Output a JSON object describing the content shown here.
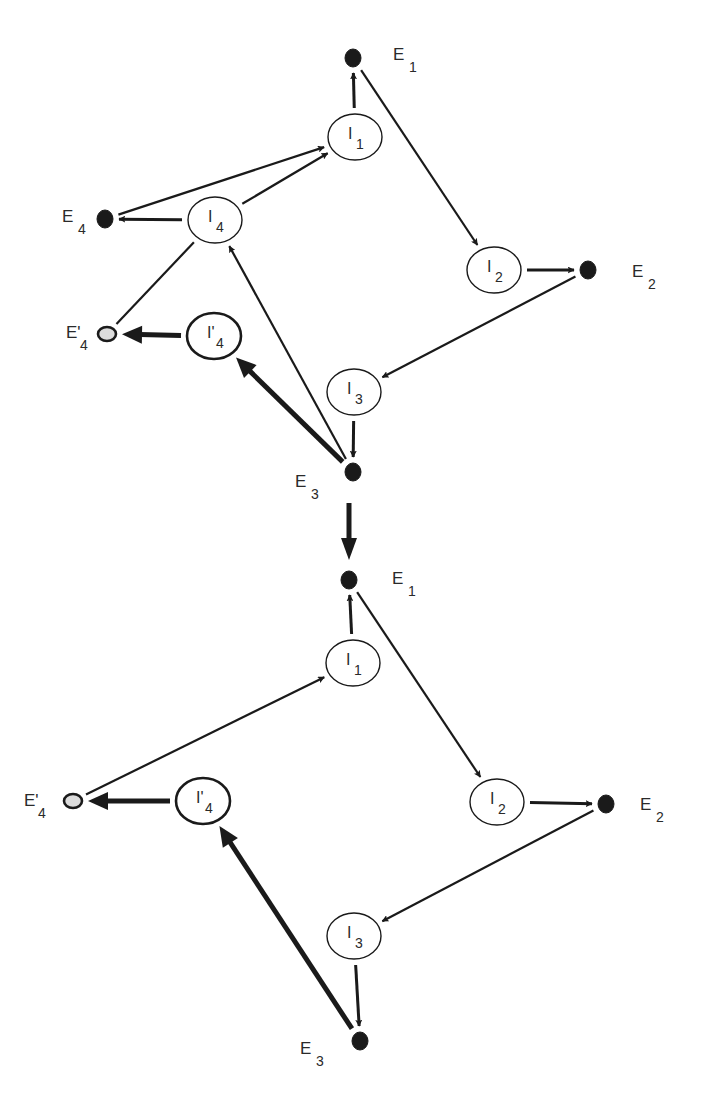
{
  "colors": {
    "stroke": "#1a1a1a",
    "filled_dot": "#1a1a1a",
    "open_dot_fill": "#dcdcdc",
    "background": "#ffffff"
  },
  "top_panel": {
    "nodes": [
      {
        "id": "E1",
        "kind": "dot",
        "x": 353,
        "y": 58,
        "label": "E",
        "sub": "1",
        "lx": 393,
        "ly": 60
      },
      {
        "id": "I1",
        "kind": "circle",
        "x": 355,
        "y": 137,
        "label": "I",
        "sub": "1"
      },
      {
        "id": "I2",
        "kind": "circle",
        "x": 494,
        "y": 270,
        "label": "I",
        "sub": "2"
      },
      {
        "id": "E2",
        "kind": "dot",
        "x": 588,
        "y": 270,
        "label": "E",
        "sub": "2",
        "lx": 632,
        "ly": 277
      },
      {
        "id": "I3",
        "kind": "circle",
        "x": 354,
        "y": 392,
        "label": "I",
        "sub": "3"
      },
      {
        "id": "E3",
        "kind": "dot",
        "x": 353,
        "y": 472,
        "label": "E",
        "sub": "3",
        "lx": 295,
        "ly": 487
      },
      {
        "id": "I4",
        "kind": "circle",
        "x": 215,
        "y": 220,
        "label": "I",
        "sub": "4"
      },
      {
        "id": "E4",
        "kind": "dot",
        "x": 105,
        "y": 219,
        "label": "E",
        "sub": "4",
        "lx": 62,
        "ly": 222
      },
      {
        "id": "I'4",
        "kind": "circle-thick",
        "x": 214,
        "y": 336,
        "label": "I'",
        "sub": "4"
      },
      {
        "id": "E'4",
        "kind": "open-dot",
        "x": 107,
        "y": 334,
        "label": "E'",
        "sub": "4",
        "lx": 66,
        "ly": 338
      }
    ],
    "edges": [
      {
        "from": "I1",
        "to": "E1",
        "weight": "normal"
      },
      {
        "from": "E1",
        "to": "I2",
        "weight": "thin"
      },
      {
        "from": "I2",
        "to": "E2",
        "weight": "normal"
      },
      {
        "from": "E2",
        "to": "I3",
        "weight": "thin"
      },
      {
        "from": "I3",
        "to": "E3",
        "weight": "normal"
      },
      {
        "from": "E3",
        "to": "I4",
        "weight": "thin"
      },
      {
        "from": "E3",
        "to": "I'4",
        "weight": "thick"
      },
      {
        "from": "I4",
        "to": "E4",
        "weight": "normal"
      },
      {
        "from": "E4",
        "to": "I1",
        "weight": "thin"
      },
      {
        "from": "I4",
        "to": "I1",
        "weight": "thin"
      },
      {
        "from": "E'4",
        "to": "I4",
        "weight": "thin",
        "arrow": false
      },
      {
        "from": "I'4",
        "to": "E'4",
        "weight": "thick"
      }
    ]
  },
  "transition_arrow": {
    "x": 349,
    "y1": 503,
    "y2": 560
  },
  "bottom_panel": {
    "nodes": [
      {
        "id": "E1",
        "kind": "dot",
        "x": 349,
        "y": 580,
        "label": "E",
        "sub": "1",
        "lx": 392,
        "ly": 584
      },
      {
        "id": "I1",
        "kind": "circle",
        "x": 353,
        "y": 663,
        "label": "I",
        "sub": "1"
      },
      {
        "id": "I2",
        "kind": "circle",
        "x": 497,
        "y": 802,
        "label": "I",
        "sub": "2"
      },
      {
        "id": "E2",
        "kind": "dot",
        "x": 606,
        "y": 804,
        "label": "E",
        "sub": "2",
        "lx": 640,
        "ly": 810
      },
      {
        "id": "I3",
        "kind": "circle",
        "x": 354,
        "y": 936,
        "label": "I",
        "sub": "3"
      },
      {
        "id": "E3",
        "kind": "dot",
        "x": 360,
        "y": 1041,
        "label": "E",
        "sub": "3",
        "lx": 300,
        "ly": 1054
      },
      {
        "id": "I'4",
        "kind": "circle-thick",
        "x": 203,
        "y": 801,
        "label": "I'",
        "sub": "4"
      },
      {
        "id": "E'4",
        "kind": "open-dot",
        "x": 73,
        "y": 801,
        "label": "E'",
        "sub": "4",
        "lx": 24,
        "ly": 806
      }
    ],
    "edges": [
      {
        "from": "I1",
        "to": "E1",
        "weight": "normal"
      },
      {
        "from": "E1",
        "to": "I2",
        "weight": "thin"
      },
      {
        "from": "I2",
        "to": "E2",
        "weight": "normal"
      },
      {
        "from": "E2",
        "to": "I3",
        "weight": "thin"
      },
      {
        "from": "I3",
        "to": "E3",
        "weight": "normal"
      },
      {
        "from": "E3",
        "to": "I'4",
        "weight": "thick"
      },
      {
        "from": "E'4",
        "to": "I1",
        "weight": "thin"
      },
      {
        "from": "I'4",
        "to": "E'4",
        "weight": "thick"
      }
    ]
  }
}
